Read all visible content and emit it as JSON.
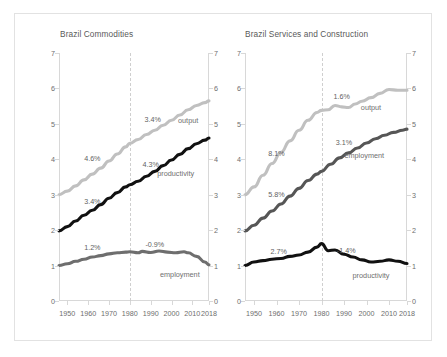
{
  "figure": {
    "background": "#ffffff",
    "border_color": "#e2e2e2"
  },
  "colors": {
    "output": "#c0c0c0",
    "employment_left": "#6e6e6e",
    "productivity_left": "#111111",
    "employment_right": "#565656",
    "productivity_right": "#111111",
    "axis": "#d8d8d8",
    "divider": "#cfcfcf",
    "text": "#5f5f5f"
  },
  "chart_data": [
    {
      "type": "line",
      "title": "Brazil Commodities",
      "xlabel": "",
      "ylabel": "",
      "xlim": [
        1946,
        2018
      ],
      "ylim": [
        0,
        7
      ],
      "yticks": [
        0,
        1,
        2,
        3,
        4,
        5,
        6,
        7
      ],
      "ytick_labels": [
        "0",
        "1",
        "2",
        "3",
        "4",
        "5",
        "6",
        "7"
      ],
      "xticks": [
        1950,
        1960,
        1970,
        1980,
        1990,
        2000,
        2010,
        2018
      ],
      "xtick_labels": [
        "1950",
        "1960",
        "1970",
        "1980",
        "1990",
        "2000",
        "2010",
        "2018"
      ],
      "grid": false,
      "dual_y_axis": true,
      "vline": 1980,
      "vline_style": "dashed",
      "legend": "inline-labels",
      "series": [
        {
          "name": "output",
          "color": "#c0c0c0",
          "label": "output",
          "label_at": {
            "x": 2008,
            "y": 5.12
          },
          "annotations": [
            {
              "text": "4.6%",
              "x": 1962,
              "y": 4.05
            },
            {
              "text": "3.4%",
              "x": 1991,
              "y": 5.13
            }
          ],
          "x": [
            1946,
            1950,
            1954,
            1958,
            1962,
            1966,
            1970,
            1974,
            1978,
            1980,
            1984,
            1988,
            1992,
            1996,
            2000,
            2004,
            2008,
            2012,
            2016,
            2018
          ],
          "y": [
            3.0,
            3.1,
            3.25,
            3.42,
            3.58,
            3.75,
            3.95,
            4.15,
            4.35,
            4.45,
            4.56,
            4.7,
            4.82,
            4.96,
            5.1,
            5.25,
            5.4,
            5.52,
            5.6,
            5.65
          ]
        },
        {
          "name": "productivity",
          "color": "#111111",
          "label": "productivity",
          "label_at": {
            "x": 2002,
            "y": 3.62
          },
          "annotations": [
            {
              "text": "3.4%",
              "x": 1962,
              "y": 2.82
            },
            {
              "text": "4.3%",
              "x": 1990,
              "y": 3.88
            }
          ],
          "x": [
            1946,
            1950,
            1954,
            1958,
            1962,
            1966,
            1970,
            1974,
            1978,
            1980,
            1984,
            1988,
            1992,
            1996,
            2000,
            2004,
            2008,
            2012,
            2016,
            2018
          ],
          "y": [
            1.98,
            2.1,
            2.26,
            2.42,
            2.56,
            2.72,
            2.9,
            3.06,
            3.22,
            3.28,
            3.38,
            3.52,
            3.66,
            3.82,
            3.98,
            4.14,
            4.3,
            4.44,
            4.54,
            4.6
          ]
        },
        {
          "name": "employment",
          "color": "#6e6e6e",
          "label": "employment",
          "label_at": {
            "x": 2004,
            "y": 0.76
          },
          "annotations": [
            {
              "text": "1.2%",
              "x": 1962,
              "y": 1.52
            },
            {
              "text": "-0.9%",
              "x": 1992,
              "y": 1.62
            }
          ],
          "x": [
            1946,
            1950,
            1954,
            1958,
            1962,
            1966,
            1970,
            1974,
            1978,
            1980,
            1984,
            1986,
            1990,
            1994,
            1998,
            2002,
            2006,
            2008,
            2012,
            2016,
            2018
          ],
          "y": [
            1.0,
            1.05,
            1.12,
            1.18,
            1.24,
            1.28,
            1.33,
            1.36,
            1.38,
            1.39,
            1.36,
            1.4,
            1.37,
            1.41,
            1.38,
            1.36,
            1.39,
            1.36,
            1.26,
            1.1,
            1.02
          ]
        }
      ]
    },
    {
      "type": "line",
      "title": "Brazil Services and Construction",
      "xlabel": "",
      "ylabel": "",
      "xlim": [
        1946,
        2018
      ],
      "ylim": [
        0,
        7
      ],
      "yticks": [
        0,
        1,
        2,
        3,
        4,
        5,
        6,
        7
      ],
      "ytick_labels": [
        "0",
        "1",
        "2",
        "3",
        "4",
        "5",
        "6",
        "7"
      ],
      "xticks": [
        1950,
        1960,
        1970,
        1980,
        1990,
        2000,
        2010,
        2018
      ],
      "xtick_labels": [
        "1950",
        "1960",
        "1970",
        "1980",
        "1990",
        "2000",
        "2010",
        "2018"
      ],
      "grid": false,
      "dual_y_axis": true,
      "vline": 1980,
      "vline_style": "dashed",
      "legend": "inline-labels",
      "series": [
        {
          "name": "output",
          "color": "#c0c0c0",
          "label": "output",
          "label_at": {
            "x": 2002,
            "y": 5.48
          },
          "annotations": [
            {
              "text": "8.1%",
              "x": 1960,
              "y": 4.18
            },
            {
              "text": "1.6%",
              "x": 1989,
              "y": 5.8
            }
          ],
          "x": [
            1946,
            1950,
            1954,
            1958,
            1962,
            1966,
            1970,
            1974,
            1978,
            1980,
            1983,
            1986,
            1989,
            1992,
            1995,
            1998,
            2002,
            2006,
            2010,
            2014,
            2018
          ],
          "y": [
            3.0,
            3.22,
            3.55,
            3.88,
            4.2,
            4.52,
            4.82,
            5.1,
            5.32,
            5.38,
            5.4,
            5.52,
            5.48,
            5.46,
            5.56,
            5.64,
            5.74,
            5.86,
            5.97,
            5.95,
            5.95
          ]
        },
        {
          "name": "employment",
          "color": "#565656",
          "label": "employment",
          "label_at": {
            "x": 1999,
            "y": 4.12
          },
          "annotations": [
            {
              "text": "5.8%",
              "x": 1960,
              "y": 3.02
            },
            {
              "text": "3.1%",
              "x": 1990,
              "y": 4.48
            }
          ],
          "x": [
            1946,
            1950,
            1954,
            1958,
            1962,
            1966,
            1970,
            1974,
            1978,
            1980,
            1984,
            1988,
            1992,
            1996,
            2000,
            2004,
            2008,
            2012,
            2016,
            2018
          ],
          "y": [
            1.98,
            2.14,
            2.34,
            2.54,
            2.74,
            2.96,
            3.18,
            3.4,
            3.58,
            3.66,
            3.86,
            4.04,
            4.18,
            4.32,
            4.46,
            4.58,
            4.68,
            4.76,
            4.82,
            4.85
          ]
        },
        {
          "name": "productivity",
          "color": "#111111",
          "label": "productivity",
          "label_at": {
            "x": 2002,
            "y": 0.73
          },
          "annotations": [
            {
              "text": "2.7%",
              "x": 1961,
              "y": 1.4
            },
            {
              "text": "-1.4%",
              "x": 1991,
              "y": 1.44
            }
          ],
          "x": [
            1946,
            1950,
            1954,
            1958,
            1962,
            1966,
            1970,
            1974,
            1978,
            1980,
            1983,
            1986,
            1990,
            1994,
            1998,
            2002,
            2006,
            2010,
            2014,
            2018
          ],
          "y": [
            1.0,
            1.1,
            1.14,
            1.18,
            1.2,
            1.26,
            1.3,
            1.38,
            1.52,
            1.62,
            1.42,
            1.44,
            1.32,
            1.24,
            1.16,
            1.1,
            1.12,
            1.16,
            1.12,
            1.06
          ]
        }
      ]
    }
  ]
}
